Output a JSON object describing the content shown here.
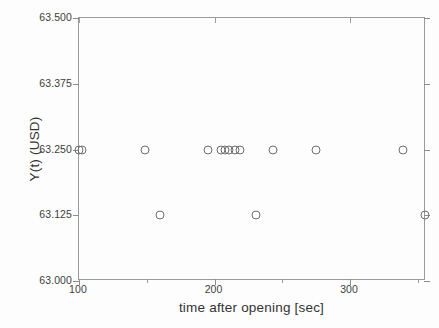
{
  "chart_data": {
    "type": "scatter",
    "title": "",
    "xlabel": "time after opening [sec]",
    "ylabel": "Y(t)  (USD)",
    "xlim": [
      100,
      356
    ],
    "ylim": [
      63.0,
      63.5
    ],
    "xticks": [
      100,
      200,
      300
    ],
    "xtick_labels": [
      "100",
      "200",
      "300"
    ],
    "xticks_minor": [
      150,
      250,
      350
    ],
    "yticks": [
      63.0,
      63.125,
      63.25,
      63.375,
      63.5
    ],
    "ytick_labels": [
      "63.000",
      "63.125",
      "63.250",
      "63.375",
      "63.500"
    ],
    "grid": false,
    "legend": null,
    "marker": "open-circle",
    "marker_color": "#6e6e6e",
    "points": [
      {
        "x": 100.0,
        "y": 63.25
      },
      {
        "x": 102.5,
        "y": 63.25
      },
      {
        "x": 149.0,
        "y": 63.25
      },
      {
        "x": 159.5,
        "y": 63.125
      },
      {
        "x": 195.0,
        "y": 63.25
      },
      {
        "x": 204.5,
        "y": 63.25
      },
      {
        "x": 207.5,
        "y": 63.25
      },
      {
        "x": 210.5,
        "y": 63.25
      },
      {
        "x": 215.0,
        "y": 63.25
      },
      {
        "x": 218.5,
        "y": 63.25
      },
      {
        "x": 230.5,
        "y": 63.125
      },
      {
        "x": 243.0,
        "y": 63.25
      },
      {
        "x": 274.5,
        "y": 63.25
      },
      {
        "x": 339.0,
        "y": 63.25
      },
      {
        "x": 355.0,
        "y": 63.125
      }
    ]
  }
}
